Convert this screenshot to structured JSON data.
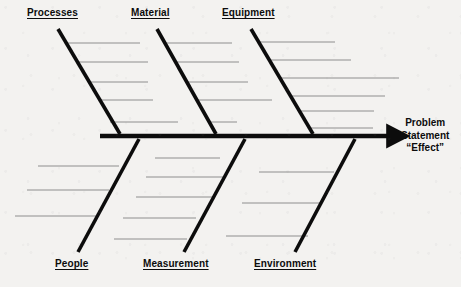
{
  "diagram": {
    "type": "fishbone-ishikawa",
    "title": "",
    "background_color": "#f3f2f0",
    "spine_color": "#0c0c0c",
    "bone_color": "#0c0c0c",
    "subbone_color": "#8e8e8e",
    "label_color": "#0c0c0c"
  },
  "effect": {
    "line1": "Problem",
    "line2": "Statement",
    "line3": "“Effect”"
  },
  "spine": {
    "x1": 100,
    "y1": 136,
    "x2": 396,
    "y2": 136,
    "arrow_tip_x": 396,
    "stroke_width": 4.5
  },
  "categories": [
    {
      "id": "processes",
      "label": "Processes",
      "position": "top",
      "label_left": 27,
      "label_top": 7,
      "bone": {
        "x1": 58,
        "y1": 29,
        "x2": 120,
        "y2": 134
      },
      "subbones": [
        {
          "x1": 66,
          "x2": 140,
          "y": 43
        },
        {
          "x1": 77,
          "x2": 148,
          "y": 62
        },
        {
          "x1": 88,
          "x2": 148,
          "y": 82
        },
        {
          "x1": 99,
          "x2": 153,
          "y": 100
        },
        {
          "x1": 110,
          "x2": 178,
          "y": 122
        }
      ]
    },
    {
      "id": "material",
      "label": "Material",
      "position": "top",
      "label_left": 131,
      "label_top": 7,
      "bone": {
        "x1": 157,
        "y1": 29,
        "x2": 216,
        "y2": 134
      },
      "subbones": [
        {
          "x1": 165,
          "x2": 232,
          "y": 43
        },
        {
          "x1": 176,
          "x2": 239,
          "y": 62
        },
        {
          "x1": 187,
          "x2": 248,
          "y": 82
        },
        {
          "x1": 198,
          "x2": 272,
          "y": 100
        },
        {
          "x1": 208,
          "x2": 237,
          "y": 122
        }
      ]
    },
    {
      "id": "equipment",
      "label": "Equipment",
      "position": "top",
      "label_left": 222,
      "label_top": 7,
      "bone": {
        "x1": 251,
        "y1": 29,
        "x2": 313,
        "y2": 134
      },
      "subbones": [
        {
          "x1": 258,
          "x2": 335,
          "y": 42
        },
        {
          "x1": 269,
          "x2": 351,
          "y": 60
        },
        {
          "x1": 279,
          "x2": 399,
          "y": 78
        },
        {
          "x1": 290,
          "x2": 385,
          "y": 96
        },
        {
          "x1": 300,
          "x2": 374,
          "y": 111
        },
        {
          "x1": 309,
          "x2": 373,
          "y": 128
        }
      ]
    },
    {
      "id": "people",
      "label": "People",
      "position": "bottom",
      "label_left": 55,
      "label_top": 258,
      "bone": {
        "x1": 139,
        "y1": 139,
        "x2": 78,
        "y2": 252
      },
      "subbones": [
        {
          "x1": 38,
          "x2": 119,
          "y": 166
        },
        {
          "x1": 27,
          "x2": 109,
          "y": 190
        },
        {
          "x1": 15,
          "x2": 98,
          "y": 216
        }
      ]
    },
    {
      "id": "measurement",
      "label": "Measurement",
      "position": "bottom",
      "label_left": 143,
      "label_top": 258,
      "bone": {
        "x1": 245,
        "y1": 139,
        "x2": 184,
        "y2": 252
      },
      "subbones": [
        {
          "x1": 155,
          "x2": 220,
          "y": 158
        },
        {
          "x1": 146,
          "x2": 224,
          "y": 177
        },
        {
          "x1": 136,
          "x2": 215,
          "y": 197
        },
        {
          "x1": 123,
          "x2": 196,
          "y": 218
        },
        {
          "x1": 114,
          "x2": 187,
          "y": 239
        }
      ]
    },
    {
      "id": "environment",
      "label": "Environment",
      "position": "bottom",
      "label_left": 254,
      "label_top": 258,
      "bone": {
        "x1": 355,
        "y1": 139,
        "x2": 295,
        "y2": 252
      },
      "subbones": [
        {
          "x1": 259,
          "x2": 334,
          "y": 172
        },
        {
          "x1": 242,
          "x2": 321,
          "y": 203
        },
        {
          "x1": 226,
          "x2": 308,
          "y": 236
        }
      ]
    }
  ]
}
